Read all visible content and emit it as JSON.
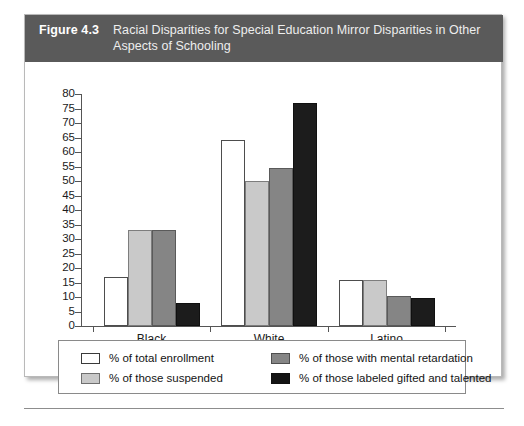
{
  "figure": {
    "number": "Figure 4.3",
    "title": "Racial Disparities for Special Education Mirror Disparities in Other Aspects of Schooling"
  },
  "chart_data": {
    "type": "bar",
    "title": "Racial Disparities for Special Education Mirror Disparities in Other Aspects of Schooling",
    "xlabel": "",
    "ylabel": "",
    "ylim": [
      0,
      80
    ],
    "ytick_step": 5,
    "yticks": [
      0,
      5,
      10,
      15,
      20,
      25,
      30,
      35,
      40,
      45,
      50,
      55,
      60,
      65,
      70,
      75,
      80
    ],
    "grid": false,
    "legend_position": "bottom",
    "categories": [
      "Black",
      "White",
      "Latino"
    ],
    "series": [
      {
        "name": "% of total enrollment",
        "color": "#ffffff",
        "swatch": "c-white",
        "values": [
          17,
          64,
          16
        ]
      },
      {
        "name": "% of those suspended",
        "color": "#c9c9c9",
        "swatch": "c-ltgray",
        "values": [
          33,
          50,
          16
        ]
      },
      {
        "name": "% of those with mental retardation",
        "color": "#858585",
        "swatch": "c-dkgray",
        "values": [
          33,
          54.5,
          10.5
        ]
      },
      {
        "name": "% of those labeled gifted and talented",
        "color": "#1c1c1c",
        "swatch": "c-black",
        "values": [
          8,
          77,
          9.5
        ]
      }
    ]
  },
  "legend": {
    "items": [
      {
        "label": "% of total enrollment",
        "swatch": "c-white"
      },
      {
        "label": "% of those with mental retardation",
        "swatch": "c-dkgray"
      },
      {
        "label": "% of those suspended",
        "swatch": "c-ltgray"
      },
      {
        "label": "% of those labeled gifted and talented",
        "swatch": "c-black"
      }
    ]
  }
}
